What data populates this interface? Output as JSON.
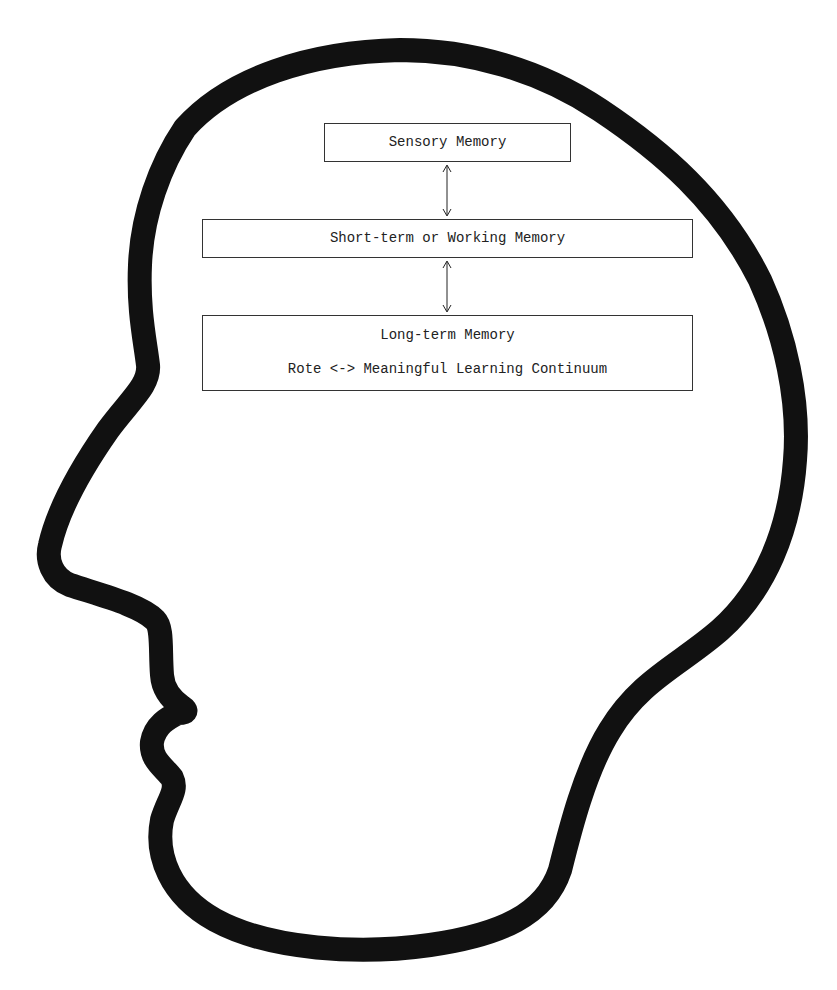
{
  "diagram": {
    "type": "memory-model-in-head-silhouette",
    "boxes": [
      {
        "id": "sensory",
        "label": "Sensory Memory"
      },
      {
        "id": "short_term",
        "label": "Short-term or Working Memory"
      },
      {
        "id": "long_term",
        "label": "Long-term Memory",
        "sublabel": "Rote <-> Meaningful Learning Continuum"
      }
    ],
    "connections": [
      {
        "from": "sensory",
        "to": "short_term",
        "style": "bidirectional-arrow"
      },
      {
        "from": "short_term",
        "to": "long_term",
        "style": "bidirectional-arrow"
      }
    ],
    "outline": {
      "shape": "human-head-profile-facing-left",
      "stroke_color": "#111111"
    }
  }
}
